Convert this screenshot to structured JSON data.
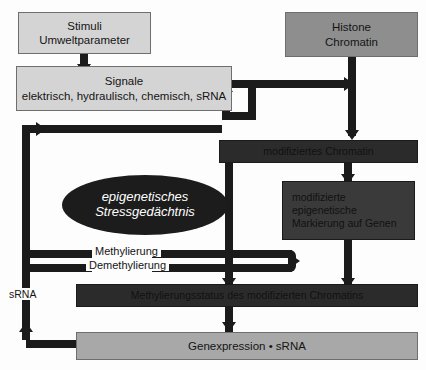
{
  "diagram": {
    "colors": {
      "light_box": "#d4d4d4",
      "mid_box": "#8e8e8e",
      "dark_box": "#2b2b2b",
      "dark_box_alt": "#3a3a3a",
      "ellipse": "#1c1c1c",
      "arrow": "#1b1b1b",
      "background": "#fdfdfd"
    },
    "nodes": {
      "stimuli": {
        "line1": "Stimuli",
        "line2": "Umweltparameter"
      },
      "signale": {
        "line1": "Signale",
        "line2": "elektrisch, hydraulisch, chemisch, sRNA"
      },
      "histone": {
        "line1": "Histone",
        "line2": "Chromatin"
      },
      "modifiziertes_chromatin": {
        "label": "modifiziertes Chromatin"
      },
      "markierung": {
        "line1": "modifizierte",
        "line2": "epigenetische",
        "line3": "Markierung auf Genen"
      },
      "gedaechtnis": {
        "line1": "epigenetisches",
        "line2": "Stressgedächtnis"
      },
      "methylierungsstatus": {
        "label": "Methylierungsstatus des modifizierten Chromatins"
      },
      "genexpression": {
        "label": "Genexpression • sRNA"
      }
    },
    "edge_labels": {
      "methylierung": "Methylierung",
      "demethylierung": "Demethylierung",
      "srna": "sRNA"
    }
  }
}
